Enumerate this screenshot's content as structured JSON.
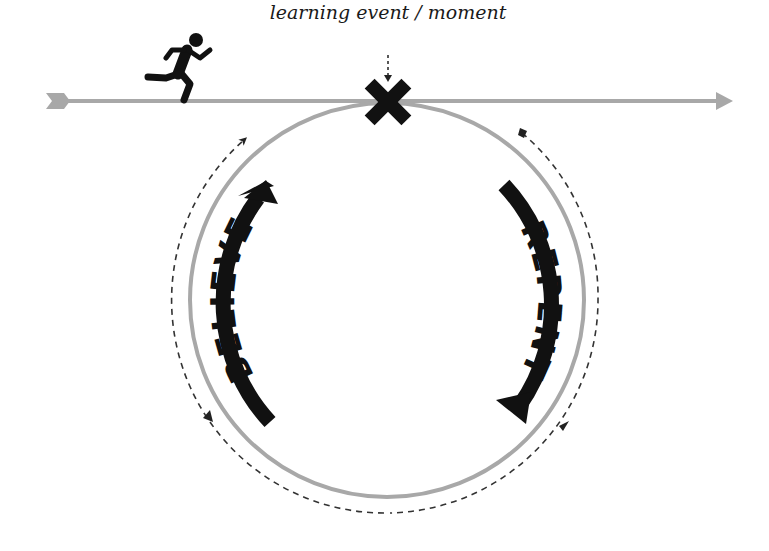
{
  "diagram": {
    "caption": "learning event / moment",
    "left_label": "BELIEVE",
    "right_label": "REPENT",
    "icons": {
      "runner": "running-person-icon",
      "event_marker": "x-mark-icon"
    },
    "colors": {
      "timeline": "#a8a8a8",
      "circle": "#a8a8a8",
      "arrows": "#111111",
      "dashed": "#333333",
      "background": "#ffffff"
    },
    "geometry": {
      "circle_center": [
        387,
        300
      ],
      "circle_radius": 197,
      "dashed_radius": 213,
      "timeline_y": 101
    }
  }
}
